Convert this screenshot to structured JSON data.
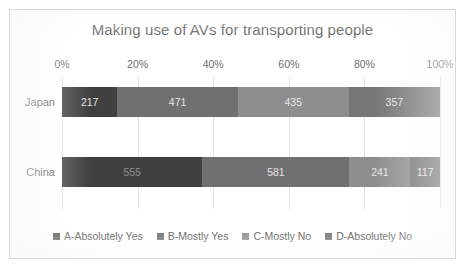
{
  "chart_data": {
    "type": "bar",
    "orientation": "horizontal",
    "stacked": true,
    "normalized": true,
    "title": "Making use of AVs for transporting people",
    "xlabel": "",
    "ylabel": "",
    "categories": [
      "Japan",
      "China"
    ],
    "tick_labels": [
      "0%",
      "20%",
      "40%",
      "60%",
      "80%",
      "100%"
    ],
    "tick_values": [
      0,
      20,
      40,
      60,
      80,
      100
    ],
    "xlim": [
      0,
      100
    ],
    "grid": true,
    "legend_position": "bottom",
    "series": [
      {
        "name": "A-Absolutely Yes",
        "color": "#404040",
        "values": [
          217,
          555
        ]
      },
      {
        "name": "B-Mostly Yes",
        "color": "#707070",
        "values": [
          471,
          581
        ]
      },
      {
        "name": "C-Mostly No",
        "color": "#8e8e8e",
        "values": [
          435,
          241
        ]
      },
      {
        "name": "D-Absolutely No",
        "color": "#767676",
        "values": [
          357,
          117
        ]
      }
    ],
    "totals": [
      1480,
      1494
    ]
  }
}
